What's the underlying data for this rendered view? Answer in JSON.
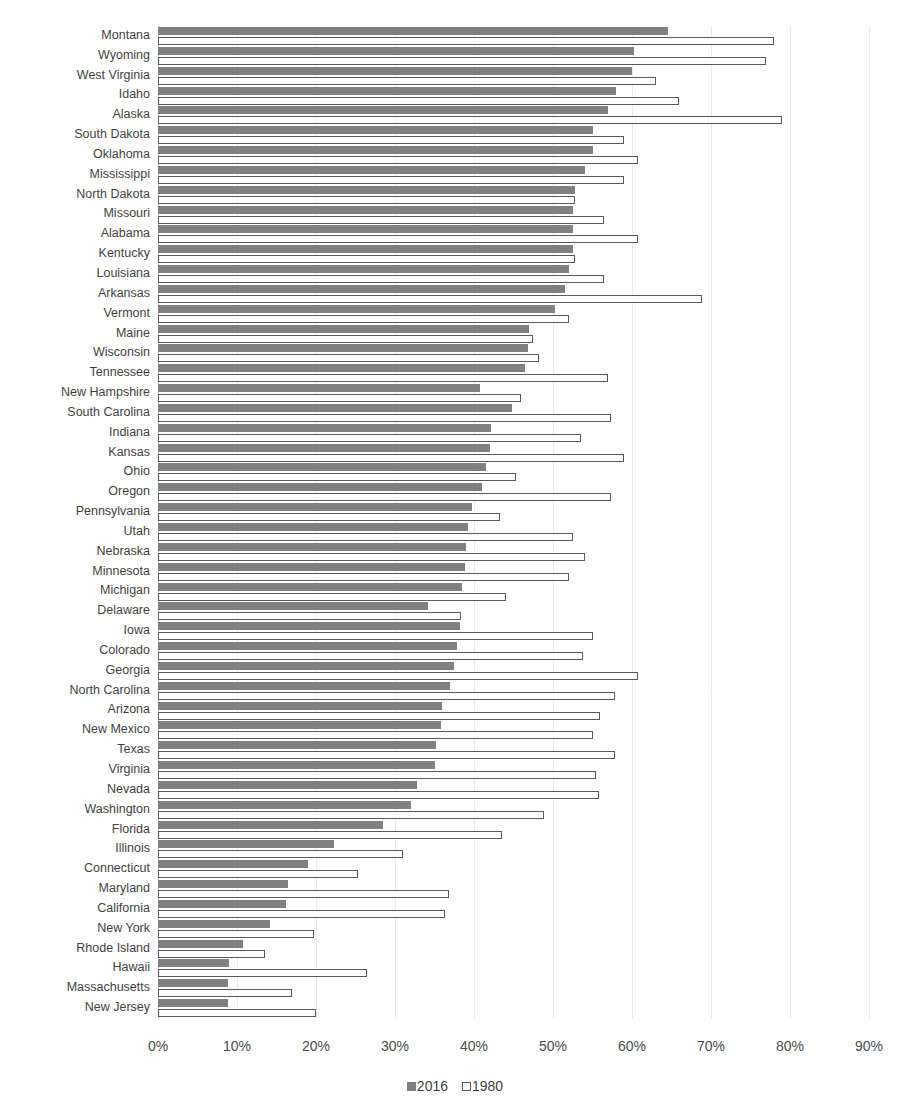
{
  "title": "",
  "legend": {
    "position": "bottom-center",
    "items": [
      {
        "label": "2016",
        "color": "#808080",
        "style": "filled"
      },
      {
        "label": "1980",
        "color": "#ffffff",
        "style": "outlined"
      }
    ]
  },
  "axis": {
    "xlabel": "",
    "ylabel": "",
    "xticks": [
      "0%",
      "10%",
      "20%",
      "30%",
      "40%",
      "50%",
      "60%",
      "70%",
      "80%",
      "90%"
    ],
    "xlim": [
      0,
      90
    ],
    "grid": "vertical-light"
  },
  "chart_data": {
    "type": "bar",
    "orientation": "horizontal",
    "title": "",
    "xlabel": "",
    "ylabel": "",
    "xlim": [
      0,
      90
    ],
    "xticks": [
      0,
      10,
      20,
      30,
      40,
      50,
      60,
      70,
      80,
      90
    ],
    "tick_format": "percent",
    "grid": true,
    "legend_position": "bottom-center",
    "categories": [
      "Montana",
      "Wyoming",
      "West Virginia",
      "Idaho",
      "Alaska",
      "South Dakota",
      "Oklahoma",
      "Mississippi",
      "North Dakota",
      "Missouri",
      "Alabama",
      "Kentucky",
      "Louisiana",
      "Arkansas",
      "Vermont",
      "Maine",
      "Wisconsin",
      "Tennessee",
      "New Hampshire",
      "South Carolina",
      "Indiana",
      "Kansas",
      "Ohio",
      "Oregon",
      "Pennsylvania",
      "Utah",
      "Nebraska",
      "Minnesota",
      "Michigan",
      "Delaware",
      "Iowa",
      "Colorado",
      "Georgia",
      "North Carolina",
      "Arizona",
      "New Mexico",
      "Texas",
      "Virginia",
      "Nevada",
      "Washington",
      "Florida",
      "Illinois",
      "Connecticut",
      "Maryland",
      "California",
      "New York",
      "Rhode Island",
      "Hawaii",
      "Massachusetts",
      "New Jersey"
    ],
    "series": [
      {
        "name": "2016",
        "color": "#808080",
        "values": [
          64.5,
          60.3,
          60.0,
          58.0,
          57.0,
          55.0,
          55.0,
          54.0,
          52.8,
          52.5,
          52.5,
          52.5,
          52.0,
          51.5,
          50.3,
          47.0,
          46.8,
          46.5,
          40.8,
          44.8,
          42.2,
          42.0,
          41.5,
          41.0,
          39.8,
          39.3,
          39.0,
          38.8,
          38.5,
          34.2,
          38.2,
          37.8,
          37.5,
          37.0,
          36.0,
          35.8,
          35.2,
          35.0,
          32.8,
          32.0,
          28.5,
          22.3,
          19.0,
          16.5,
          16.2,
          14.2,
          10.8,
          9.0,
          8.8,
          8.8
        ]
      },
      {
        "name": "1980",
        "color": "#ffffff",
        "values": [
          78.0,
          77.0,
          63.0,
          66.0,
          79.0,
          59.0,
          60.8,
          59.0,
          52.8,
          56.5,
          60.8,
          52.8,
          56.5,
          68.9,
          52.0,
          47.5,
          48.2,
          57.0,
          46.0,
          57.3,
          53.5,
          59.0,
          45.3,
          57.3,
          43.3,
          52.5,
          54.0,
          52.0,
          44.0,
          38.3,
          55.0,
          53.8,
          60.8,
          57.8,
          56.0,
          55.0,
          57.8,
          55.5,
          55.8,
          48.8,
          43.5,
          31.0,
          25.3,
          36.8,
          36.3,
          19.8,
          13.5,
          26.5,
          17.0,
          20.0
        ]
      }
    ]
  }
}
